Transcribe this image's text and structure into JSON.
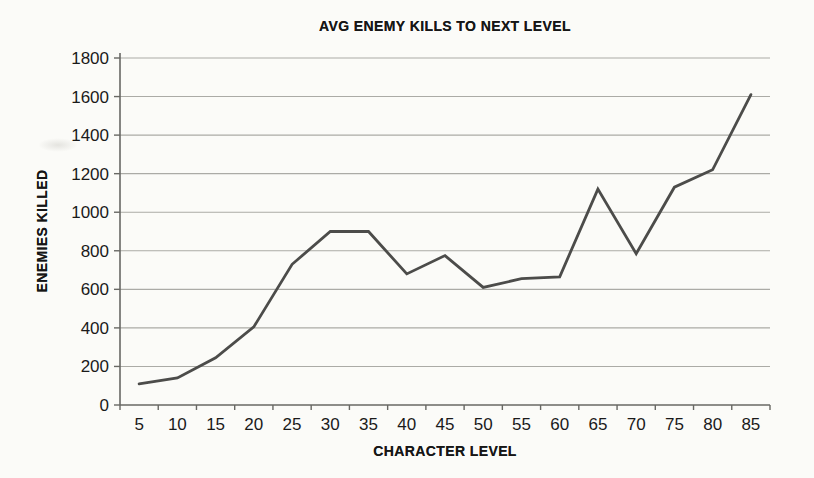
{
  "page": {
    "background_color": "#fbfbf8",
    "kind": "scanned-printed-chart"
  },
  "chart_data": {
    "type": "line",
    "title": "AVG ENEMY KILLS TO NEXT LEVEL",
    "xlabel": "CHARACTER LEVEL",
    "ylabel": "ENEMIES KILLED",
    "categories": [
      "5",
      "10",
      "15",
      "20",
      "25",
      "30",
      "35",
      "40",
      "45",
      "50",
      "55",
      "60",
      "65",
      "70",
      "75",
      "80",
      "85"
    ],
    "values": [
      110,
      140,
      245,
      405,
      730,
      900,
      900,
      680,
      775,
      610,
      655,
      665,
      1120,
      785,
      1130,
      1220,
      1610
    ],
    "series_name": "AVG ENEMY KILLS",
    "ylim": [
      0,
      1800
    ],
    "ytick_interval": 200,
    "ytick_labels": [
      "0",
      "200",
      "400",
      "600",
      "800",
      "1000",
      "1200",
      "1400",
      "1600",
      "1800"
    ],
    "grid": "horizontal",
    "legend": "none",
    "line_color": "#4c4c4a",
    "gridline_color": "#ababa6",
    "axis_color": "#686864",
    "text_color": "#1a1a1a"
  }
}
